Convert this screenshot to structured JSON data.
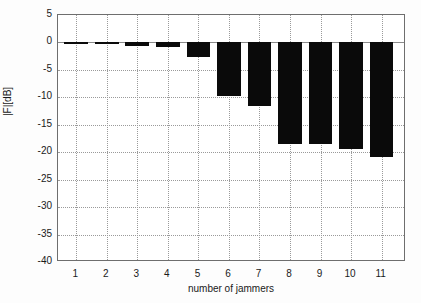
{
  "chart_data": {
    "type": "bar",
    "title": "",
    "xlabel": "number of jammers",
    "ylabel": "|F|[dB]",
    "categories": [
      "1",
      "2",
      "3",
      "4",
      "5",
      "6",
      "7",
      "8",
      "9",
      "10",
      "11"
    ],
    "values": [
      -0.1,
      -0.3,
      -0.7,
      -0.8,
      -2.6,
      -9.8,
      -11.5,
      -18.5,
      -18.5,
      -19.4,
      -20.9
    ],
    "xlim": [
      0.4,
      11.8
    ],
    "ylim": [
      -40,
      5
    ],
    "ytick_labels": [
      "5",
      "0",
      "-5",
      "-10",
      "-15",
      "-20",
      "-25",
      "-30",
      "-35",
      "-40"
    ],
    "ytick_values": [
      5,
      0,
      -5,
      -10,
      -15,
      -20,
      -25,
      -30,
      -35,
      -40
    ],
    "xtick_labels": [
      "1",
      "2",
      "3",
      "4",
      "5",
      "6",
      "7",
      "8",
      "9",
      "10",
      "11"
    ],
    "xtick_values": [
      1,
      2,
      3,
      4,
      5,
      6,
      7,
      8,
      9,
      10,
      11
    ],
    "grid": true,
    "legend": null,
    "bar_color": "#0a0a0a",
    "grid_color": "#9a9a9a",
    "axis_color": "#6e6e6e",
    "background_color": "#ffffff"
  }
}
